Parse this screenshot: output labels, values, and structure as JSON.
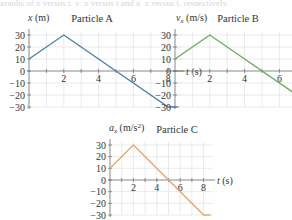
{
  "top_strip_text": "graphs of x versus t, v_x versus t and a_x versus t, respectively.",
  "chart_data": [
    {
      "type": "line",
      "title": "Particle A",
      "xlabel": "t (s)",
      "ylabel": "x (m)",
      "x": [
        0,
        2,
        8,
        8.6
      ],
      "series": [
        {
          "name": "Particle A",
          "values": [
            10,
            30,
            -30,
            -30
          ],
          "color": "#4f7fb5"
        }
      ],
      "xticks": [
        2,
        4,
        6,
        8
      ],
      "yticks": [
        30,
        20,
        10,
        0,
        -10,
        -20,
        -30
      ],
      "xlim": [
        0,
        8.8
      ],
      "ylim": [
        -30,
        30
      ],
      "grid": true,
      "legend": null
    },
    {
      "type": "line",
      "title": "Particle B",
      "xlabel": "t (s)",
      "ylabel": "v_x (m/s)",
      "x": [
        0,
        2,
        8,
        8.6
      ],
      "series": [
        {
          "name": "Particle B",
          "values": [
            10,
            30,
            -30,
            -30
          ],
          "color": "#6fae5a"
        }
      ],
      "xticks": [
        2,
        4,
        6,
        8
      ],
      "yticks": [
        30,
        20,
        10,
        0,
        -10,
        -20,
        -30
      ],
      "xlim": [
        0,
        8.8
      ],
      "ylim": [
        -30,
        30
      ],
      "grid": true,
      "legend": null
    },
    {
      "type": "line",
      "title": "Particle C",
      "xlabel": "t (s)",
      "ylabel": "a_x (m/s²)",
      "x": [
        0,
        2,
        8,
        8.6
      ],
      "series": [
        {
          "name": "Particle C",
          "values": [
            10,
            30,
            -30,
            -30
          ],
          "color": "#e9a96a"
        }
      ],
      "xticks": [
        2,
        4,
        6,
        8
      ],
      "yticks": [
        30,
        20,
        10,
        0,
        -10,
        -20,
        -30
      ],
      "xlim": [
        0,
        8.8
      ],
      "ylim": [
        -30,
        30
      ],
      "grid": true,
      "legend": null
    }
  ],
  "layout": [
    {
      "x0": 29,
      "y_top": 35,
      "y_zero": 71,
      "y_bot": 107,
      "px_per_s": 17.4,
      "title_x": 92,
      "title_y": 22,
      "ylabel_x": 28,
      "ylabel_y": 21,
      "var": "x",
      "unit": " (m)"
    },
    {
      "x0": 175,
      "y_top": 35,
      "y_zero": 71,
      "y_bot": 106,
      "px_per_s": 17.4,
      "title_x": 238,
      "title_y": 22,
      "ylabel_x": 176,
      "ylabel_y": 21,
      "var": "v",
      "sub": "x",
      "unit": " (m/s)"
    },
    {
      "x0": 110,
      "y_top": 145,
      "y_zero": 180,
      "y_bot": 215,
      "px_per_s": 11.7,
      "title_x": 177,
      "title_y": 133,
      "ylabel_x": 109,
      "ylabel_y": 131,
      "var": "a",
      "sub": "x",
      "unit": " (m/s",
      "sup": "2",
      "unit_end": ")"
    }
  ]
}
